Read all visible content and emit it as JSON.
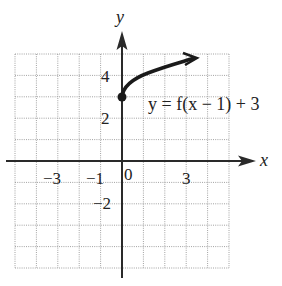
{
  "chart_data": {
    "type": "line",
    "title": "",
    "xlabel": "x",
    "ylabel": "y",
    "xlim": [
      -5,
      5
    ],
    "ylim": [
      -5,
      5
    ],
    "grid": true,
    "grid_style": "dotted",
    "x_tick_labels": [
      {
        "value": -3,
        "label": "−3"
      },
      {
        "value": -1,
        "label": "−1"
      },
      {
        "value": 0,
        "label": "0"
      },
      {
        "value": 3,
        "label": "3"
      }
    ],
    "y_tick_labels": [
      {
        "value": 4,
        "label": "4"
      },
      {
        "value": 2,
        "label": "2"
      },
      {
        "value": -2,
        "label": "−2"
      }
    ],
    "series": [
      {
        "name": "y = f(x − 1) + 3",
        "function": "sqrt-shaped curve starting at (0,3), arrow continuing right",
        "start_point": {
          "x": 0,
          "y": 3,
          "marker": "filled-dot"
        },
        "end_arrow": true,
        "points": [
          {
            "x": 0,
            "y": 3
          },
          {
            "x": 0.25,
            "y": 3.5
          },
          {
            "x": 1,
            "y": 4
          },
          {
            "x": 2,
            "y": 4.4
          },
          {
            "x": 3,
            "y": 4.7
          },
          {
            "x": 3.5,
            "y": 4.85
          }
        ]
      }
    ],
    "annotations": [
      {
        "text": "y = f(x − 1) + 3",
        "x": 1.2,
        "y": 2.6
      }
    ]
  },
  "labels": {
    "x_axis": "x",
    "y_axis": "y",
    "equation": "y = f(x − 1) + 3",
    "tick_x_neg3": "−3",
    "tick_x_neg1": "−1",
    "tick_x_0": "0",
    "tick_x_3": "3",
    "tick_y_4": "4",
    "tick_y_2": "2",
    "tick_y_neg2": "−2"
  }
}
